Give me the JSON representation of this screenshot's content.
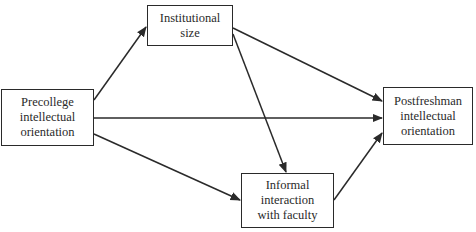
{
  "diagram": {
    "type": "path-diagram",
    "nodes": [
      {
        "id": "precollege",
        "lines": [
          "Precollege",
          "intellectual",
          "orientation"
        ]
      },
      {
        "id": "institutional",
        "lines": [
          "Institutional",
          "size"
        ]
      },
      {
        "id": "informal",
        "lines": [
          "Informal",
          "interaction",
          "with faculty"
        ]
      },
      {
        "id": "postfreshman",
        "lines": [
          "Postfreshman",
          "intellectual",
          "orientation"
        ]
      }
    ],
    "edges": [
      {
        "from": "precollege",
        "to": "institutional"
      },
      {
        "from": "precollege",
        "to": "postfreshman"
      },
      {
        "from": "precollege",
        "to": "informal"
      },
      {
        "from": "institutional",
        "to": "postfreshman"
      },
      {
        "from": "institutional",
        "to": "informal"
      },
      {
        "from": "informal",
        "to": "postfreshman"
      }
    ],
    "colors": {
      "stroke": "#2a2a2a",
      "background": "#ffffff"
    }
  }
}
